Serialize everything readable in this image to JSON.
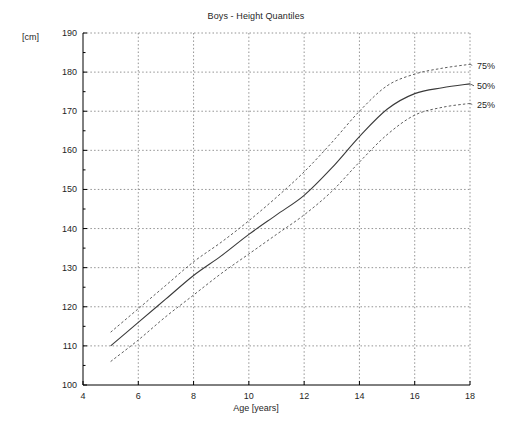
{
  "chart_data": {
    "type": "line",
    "title": "Boys - Height Quantiles",
    "xlabel": "Age [years]",
    "ylabel": "[cm]",
    "xlim": [
      4,
      18
    ],
    "ylim": [
      100,
      190
    ],
    "xticks": [
      4,
      6,
      8,
      10,
      12,
      14,
      16,
      18
    ],
    "xtick_labels": [
      "4",
      "6",
      "8",
      "10",
      "12",
      "14",
      "16",
      "18"
    ],
    "yticks": [
      100,
      110,
      120,
      130,
      140,
      150,
      160,
      170,
      180,
      190
    ],
    "ytick_labels": [
      "100",
      "110",
      "120",
      "130",
      "140",
      "150",
      "160",
      "170",
      "180",
      "190"
    ],
    "minor_xticks": [
      5,
      7,
      9,
      11,
      13,
      15,
      17
    ],
    "minor_yticks": [
      105,
      115,
      125,
      135,
      145,
      155,
      165,
      175,
      185
    ],
    "grid": true,
    "grid_style": "dotted",
    "legend_position": "right-inline",
    "x": [
      5,
      6,
      7,
      8,
      9,
      10,
      11,
      12,
      13,
      14,
      15,
      16,
      17,
      18
    ],
    "series": [
      {
        "name": "75%",
        "label": "75%",
        "style": "dashed",
        "color": "#555555",
        "label_y_value": 181.5,
        "values": [
          113.5,
          119.5,
          125.5,
          131.5,
          136.5,
          142.0,
          148.0,
          154.5,
          162.0,
          170.0,
          176.5,
          179.5,
          181.0,
          182.0
        ]
      },
      {
        "name": "50%",
        "label": "50%",
        "style": "solid",
        "color": "#3a3a3a",
        "label_y_value": 176.5,
        "values": [
          110.0,
          116.0,
          122.0,
          128.0,
          133.0,
          138.5,
          143.5,
          148.5,
          155.5,
          163.5,
          170.5,
          174.5,
          176.0,
          177.0
        ]
      },
      {
        "name": "25%",
        "label": "25%",
        "style": "dashed",
        "color": "#555555",
        "label_y_value": 171.5,
        "values": [
          106.0,
          111.5,
          117.5,
          123.0,
          128.5,
          133.5,
          138.5,
          143.5,
          149.5,
          157.0,
          164.0,
          169.0,
          171.0,
          172.0
        ]
      }
    ]
  },
  "axes": {
    "frame_color": "#000000",
    "grid_color": "#777777",
    "background": "#ffffff"
  }
}
